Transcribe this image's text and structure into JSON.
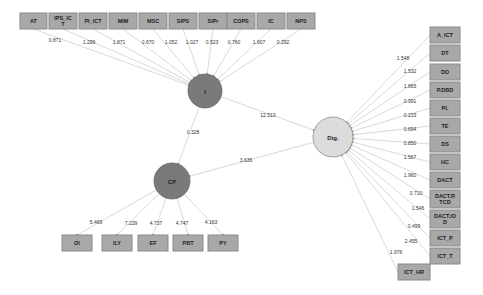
{
  "diagram": {
    "type": "structural-equation-model",
    "latent_nodes": [
      {
        "id": "I",
        "label": "I",
        "cx": 205,
        "cy": 91,
        "r": 17,
        "style": "dark"
      },
      {
        "id": "CP",
        "label": "CP",
        "cx": 172,
        "cy": 181,
        "r": 18,
        "style": "dark"
      },
      {
        "id": "Dig",
        "label": "Dig.",
        "cx": 333,
        "cy": 137,
        "r": 20,
        "style": "light"
      }
    ],
    "top_indicators": [
      {
        "label": "AT",
        "x": 20,
        "y": 13,
        "w": 27,
        "h": 16,
        "loading": "0.871",
        "lx": 55,
        "ly": 42
      },
      {
        "label": "IPS_IC\nT",
        "x": 49,
        "y": 13,
        "w": 28,
        "h": 16,
        "loading": "1.299",
        "lx": 89,
        "ly": 44
      },
      {
        "label": "PI_ICT",
        "x": 79,
        "y": 13,
        "w": 28,
        "h": 16,
        "loading": "1.871",
        "lx": 119,
        "ly": 44
      },
      {
        "label": "MIM",
        "x": 109,
        "y": 13,
        "w": 28,
        "h": 16,
        "loading": "0.670",
        "lx": 148,
        "ly": 44
      },
      {
        "label": "MSC",
        "x": 139,
        "y": 13,
        "w": 28,
        "h": 16,
        "loading": "1.052",
        "lx": 171,
        "ly": 44
      },
      {
        "label": "SIPS",
        "x": 169,
        "y": 13,
        "w": 28,
        "h": 16,
        "loading": "1.027",
        "lx": 192,
        "ly": 44
      },
      {
        "label": "SIPr",
        "x": 199,
        "y": 13,
        "w": 28,
        "h": 16,
        "loading": "0.523",
        "lx": 212,
        "ly": 44
      },
      {
        "label": "COPS",
        "x": 227,
        "y": 13,
        "w": 28,
        "h": 16,
        "loading": "0.760",
        "lx": 234,
        "ly": 44
      },
      {
        "label": "IC",
        "x": 257,
        "y": 13,
        "w": 28,
        "h": 16,
        "loading": "1.607",
        "lx": 259,
        "ly": 44
      },
      {
        "label": "NPS",
        "x": 287,
        "y": 13,
        "w": 28,
        "h": 16,
        "loading": "0.292",
        "lx": 283,
        "ly": 44
      }
    ],
    "right_indicators": [
      {
        "label": "A_ICT",
        "x": 430,
        "y": 27,
        "w": 30,
        "h": 16,
        "loading": "1.548",
        "lx": 403,
        "ly": 60
      },
      {
        "label": "DT",
        "x": 430,
        "y": 45,
        "w": 30,
        "h": 16,
        "loading": "1.532",
        "lx": 410,
        "ly": 73
      },
      {
        "label": "DO",
        "x": 430,
        "y": 64,
        "w": 30,
        "h": 16,
        "loading": "1.865",
        "lx": 410,
        "ly": 88
      },
      {
        "label": "P.DBD",
        "x": 430,
        "y": 82,
        "w": 30,
        "h": 16,
        "loading": "0.991",
        "lx": 410,
        "ly": 103
      },
      {
        "label": "PL",
        "x": 430,
        "y": 100,
        "w": 30,
        "h": 16,
        "loading": "0.233",
        "lx": 410,
        "ly": 117
      },
      {
        "label": "TE",
        "x": 430,
        "y": 118,
        "w": 30,
        "h": 16,
        "loading": "0.694",
        "lx": 410,
        "ly": 131
      },
      {
        "label": "DS",
        "x": 430,
        "y": 136,
        "w": 30,
        "h": 16,
        "loading": "0.850",
        "lx": 410,
        "ly": 145
      },
      {
        "label": "HC",
        "x": 430,
        "y": 154,
        "w": 30,
        "h": 16,
        "loading": "1.567",
        "lx": 410,
        "ly": 159
      },
      {
        "label": "DACT",
        "x": 430,
        "y": 172,
        "w": 30,
        "h": 16,
        "loading": "1.960",
        "lx": 410,
        "ly": 177
      },
      {
        "label": "DACT.R\nTCD",
        "x": 430,
        "y": 190,
        "w": 30,
        "h": 18,
        "loading": "0.710",
        "lx": 416,
        "ly": 195
      },
      {
        "label": "DACT.IO\nD",
        "x": 430,
        "y": 210,
        "w": 30,
        "h": 18,
        "loading": "1.546",
        "lx": 418,
        "ly": 210
      },
      {
        "label": "ICT_P",
        "x": 430,
        "y": 230,
        "w": 30,
        "h": 16,
        "loading": "0.499",
        "lx": 414,
        "ly": 228
      },
      {
        "label": "ICT_T",
        "x": 430,
        "y": 248,
        "w": 30,
        "h": 16,
        "loading": "2.455",
        "lx": 411,
        "ly": 243
      },
      {
        "label": "ICT_HR",
        "x": 398,
        "y": 264,
        "w": 32,
        "h": 16,
        "loading": "1.976",
        "lx": 396,
        "ly": 254
      }
    ],
    "bottom_indicators": [
      {
        "label": "OI",
        "x": 62,
        "y": 235,
        "w": 30,
        "h": 16,
        "loading": "5.469",
        "lx": 96,
        "ly": 224
      },
      {
        "label": "ILY",
        "x": 102,
        "y": 235,
        "w": 30,
        "h": 16,
        "loading": "7.239",
        "lx": 131,
        "ly": 225
      },
      {
        "label": "EF",
        "x": 138,
        "y": 235,
        "w": 30,
        "h": 16,
        "loading": "4.737",
        "lx": 156,
        "ly": 225
      },
      {
        "label": "PBT",
        "x": 173,
        "y": 235,
        "w": 30,
        "h": 16,
        "loading": "4.747",
        "lx": 182,
        "ly": 225
      },
      {
        "label": "PY",
        "x": 208,
        "y": 235,
        "w": 30,
        "h": 16,
        "loading": "4.163",
        "lx": 211,
        "ly": 224
      }
    ],
    "paths": [
      {
        "from": "I",
        "to": "Dig",
        "coefficient": "12.513",
        "lx": 268,
        "ly": 117
      },
      {
        "from": "I",
        "to": "CP",
        "coefficient": "0.328",
        "lx": 193,
        "ly": 134
      },
      {
        "from": "Dig",
        "to": "CP",
        "coefficient": "3.636",
        "lx": 246,
        "ly": 162
      }
    ]
  }
}
